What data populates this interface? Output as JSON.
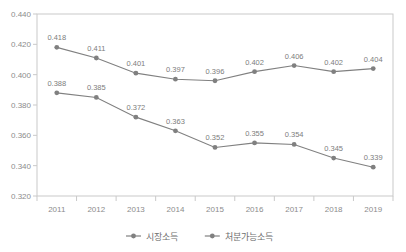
{
  "chart_data": {
    "type": "line",
    "title": "",
    "subtitle": "",
    "xlabel": "",
    "ylabel": "",
    "categories": [
      "2011",
      "2012",
      "2013",
      "2014",
      "2015",
      "2016",
      "2017",
      "2018",
      "2019"
    ],
    "ylim": [
      0.32,
      0.44
    ],
    "ytick_labels": [
      "0.440",
      "0.420",
      "0.400",
      "0.380",
      "0.360",
      "0.340",
      "0.320"
    ],
    "yticks": [
      0.44,
      0.42,
      0.4,
      0.38,
      0.36,
      0.34,
      0.32
    ],
    "grid": false,
    "legend_position": "bottom-center",
    "series": [
      {
        "name": "시장소득",
        "color": "#808080",
        "values": [
          0.418,
          0.411,
          0.401,
          0.397,
          0.396,
          0.402,
          0.406,
          0.402,
          0.404
        ],
        "labels": [
          "0.418",
          "0.411",
          "0.401",
          "0.397",
          "0.396",
          "0.402",
          "0.406",
          "0.402",
          "0.404"
        ]
      },
      {
        "name": "처분가능소득",
        "color": "#808080",
        "values": [
          0.388,
          0.385,
          0.372,
          0.363,
          0.352,
          0.355,
          0.354,
          0.345,
          0.339
        ],
        "labels": [
          "0.388",
          "0.385",
          "0.372",
          "0.363",
          "0.352",
          "0.355",
          "0.354",
          "0.345",
          "0.339"
        ]
      }
    ]
  },
  "legend": {
    "items": [
      {
        "label": "시장소득",
        "marker": "line-with-dot-marker"
      },
      {
        "label": "처분가능소득",
        "marker": "line-with-dot-marker"
      }
    ]
  },
  "colors": {
    "line": "#808080",
    "axis": "#c9c9c9",
    "text": "#8c8c8c",
    "background": "#ffffff"
  }
}
